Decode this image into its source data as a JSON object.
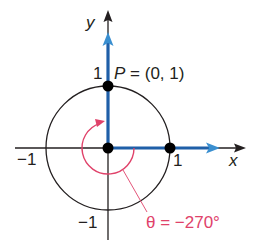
{
  "diagram": {
    "title": "",
    "axes": {
      "x_label": "x",
      "y_label": "y",
      "x_ticks": [
        "−1",
        "1"
      ],
      "y_ticks": [
        "1",
        "−1"
      ]
    },
    "circle": {
      "type": "unit circle",
      "radius": 1
    },
    "point": {
      "label": "P = (0, 1)",
      "x": 0,
      "y": 1
    },
    "angle": {
      "label": "θ = −270°",
      "degrees": -270,
      "direction": "counterclockwise-arrow",
      "color": "#e0426a"
    },
    "colors": {
      "ray": "#1f5fa8",
      "ray_arrow": "#3a8fd0",
      "axis": "#231f20",
      "circle": "#231f20",
      "angle_arc": "#e0426a"
    }
  }
}
